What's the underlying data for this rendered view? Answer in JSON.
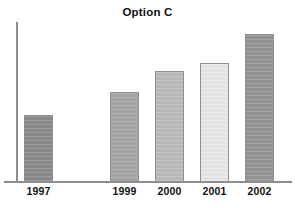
{
  "chart": {
    "title": "Option C"
  },
  "chart_data": {
    "type": "bar",
    "title": "Option C",
    "xlabel": "",
    "ylabel": "",
    "grid": false,
    "legend": false,
    "axis": {
      "y_axis_visible": true,
      "x_axis_visible": true,
      "y_tick_labels": [],
      "ylim": [
        0,
        160
      ]
    },
    "categories": [
      "1997",
      "1999",
      "2000",
      "2001",
      "2002"
    ],
    "values": [
      66,
      90,
      111,
      119,
      148
    ],
    "note_gap_between": [
      "1997",
      "1999"
    ],
    "bars": [
      {
        "label": "1997",
        "value": 66,
        "color": "#8c8c8c",
        "left": 24,
        "width": 29,
        "top": 115,
        "height": 67,
        "label_left": 14,
        "label_width": 49
      },
      {
        "label": "1999",
        "value": 90,
        "color": "#a8a8a8",
        "left": 110,
        "width": 29,
        "top": 92,
        "height": 90,
        "label_left": 100,
        "label_width": 49
      },
      {
        "label": "2000",
        "value": 111,
        "color": "#bdbdbd",
        "left": 155,
        "width": 29,
        "top": 71,
        "height": 111,
        "label_left": 145,
        "label_width": 49
      },
      {
        "label": "2001",
        "value": 119,
        "color": "#eaeaea",
        "left": 200,
        "width": 29,
        "top": 63,
        "height": 119,
        "label_left": 190,
        "label_width": 49
      },
      {
        "label": "2002",
        "value": 148,
        "color": "#969696",
        "left": 245,
        "width": 29,
        "top": 34,
        "height": 148,
        "label_left": 235,
        "label_width": 49
      }
    ],
    "colors": {
      "axis": "#8d8d8d",
      "bar_border": "#8f8f8f",
      "text": "#111111",
      "background": "#ffffff"
    }
  }
}
